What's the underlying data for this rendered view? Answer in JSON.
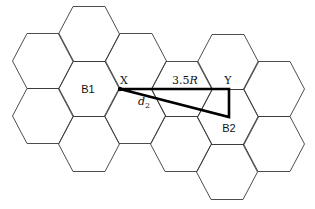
{
  "figure": {
    "type": "hexagonal cellular grid",
    "hex_geometry": {
      "vertex_radius": 30.5,
      "half_height": 27.5,
      "flat_half_width": 16
    },
    "cells": [
      {
        "cx": 43,
        "cy": 61
      },
      {
        "cx": 43,
        "cy": 116
      },
      {
        "cx": 89,
        "cy": 34
      },
      {
        "cx": 89,
        "cy": 89,
        "label": "B1"
      },
      {
        "cx": 89,
        "cy": 144
      },
      {
        "cx": 136,
        "cy": 61
      },
      {
        "cx": 135,
        "cy": 116
      },
      {
        "cx": 182,
        "cy": 89
      },
      {
        "cx": 181,
        "cy": 144
      },
      {
        "cx": 228,
        "cy": 62
      },
      {
        "cx": 228,
        "cy": 117,
        "label": "B2"
      },
      {
        "cx": 227,
        "cy": 172
      },
      {
        "cx": 274,
        "cy": 89
      },
      {
        "cx": 274,
        "cy": 144
      }
    ],
    "labels": {
      "b1": "B1",
      "b2": "B2",
      "x": "X",
      "y": "Y",
      "distance_value": "3.5",
      "distance_unit": "R",
      "d_var": "d",
      "d_sub": "2"
    },
    "triangle": {
      "x_point": [
        120,
        89
      ],
      "y_point": [
        229,
        89
      ],
      "b2_point": [
        229,
        117
      ]
    },
    "colors": {
      "grid": "#3a3a3a",
      "triangle": "#000000",
      "background": "#ffffff"
    }
  }
}
